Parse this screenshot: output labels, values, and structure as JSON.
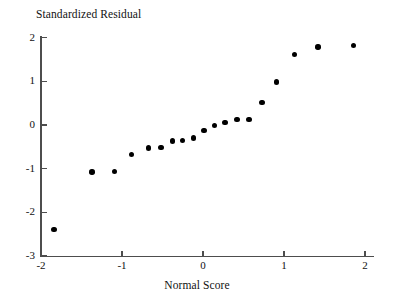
{
  "chart_data": {
    "type": "scatter",
    "title": "",
    "ylabel": "Standardized Residual",
    "xlabel": "Normal Score",
    "xlim": [
      -2.1,
      2.1
    ],
    "ylim": [
      -3,
      2.15
    ],
    "grid": false,
    "legend": null,
    "marker": "filled-circle",
    "marker_color": "#000000",
    "axis_color": "#4d4d4d",
    "xticks": [
      -2,
      -1,
      0,
      1,
      2
    ],
    "xticklabels": [
      "-2",
      "-1",
      "0",
      "1",
      "2"
    ],
    "yticks": [
      2,
      1,
      0,
      -1,
      -2,
      -3
    ],
    "yticklabels": [
      "2",
      "1",
      "0",
      "-1",
      "-2",
      "-3"
    ],
    "n_points": 22,
    "points": [
      {
        "x": -1.84,
        "y": -2.39
      },
      {
        "x": -1.37,
        "y": -1.08
      },
      {
        "x": -1.09,
        "y": -1.06
      },
      {
        "x": -0.88,
        "y": -0.68
      },
      {
        "x": -0.67,
        "y": -0.53
      },
      {
        "x": -0.52,
        "y": -0.51
      },
      {
        "x": -0.38,
        "y": -0.37
      },
      {
        "x": -0.25,
        "y": -0.35
      },
      {
        "x": -0.12,
        "y": -0.3
      },
      {
        "x": 0.01,
        "y": -0.12
      },
      {
        "x": 0.14,
        "y": -0.01
      },
      {
        "x": 0.27,
        "y": 0.06
      },
      {
        "x": 0.42,
        "y": 0.13
      },
      {
        "x": 0.57,
        "y": 0.12
      },
      {
        "x": 0.73,
        "y": 0.51
      },
      {
        "x": 0.91,
        "y": 0.99
      },
      {
        "x": 1.13,
        "y": 1.62
      },
      {
        "x": 1.42,
        "y": 1.79
      },
      {
        "x": 1.86,
        "y": 1.83
      }
    ]
  }
}
